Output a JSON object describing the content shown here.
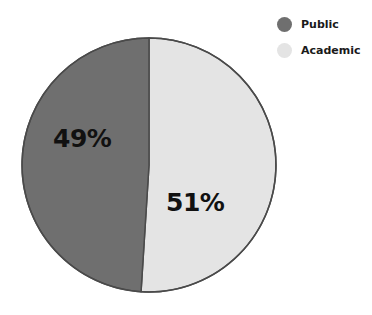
{
  "chart_data": {
    "type": "pie",
    "title": "",
    "subtitle": "",
    "xlabel": "",
    "ylabel": "",
    "legend_position": "top-right",
    "grid": false,
    "categories": [
      "Public",
      "Academic"
    ],
    "values": [
      49,
      51
    ],
    "value_labels": [
      "49%",
      "51%"
    ],
    "colors": [
      "#6f6f6f",
      "#e4e4e4"
    ],
    "slices": [
      {
        "label": "Public",
        "value": 49,
        "value_label": "49%",
        "color": "#6f6f6f",
        "start_angle_deg": 180,
        "end_angle_deg": 356.4
      },
      {
        "label": "Academic",
        "value": 51,
        "value_label": "51%",
        "color": "#e4e4e4",
        "start_angle_deg": 356.4,
        "end_angle_deg": 180
      }
    ]
  },
  "pie": {
    "center_x": 149,
    "center_y": 165,
    "radius": 127,
    "stroke_color": "#4a4a4a",
    "stroke_width": 1.5
  },
  "legend": {
    "items": [
      {
        "label": "Public",
        "color": "#6f6f6f"
      },
      {
        "label": "Academic",
        "color": "#e4e4e4"
      }
    ]
  },
  "canvas": {
    "background": "#ffffff"
  }
}
